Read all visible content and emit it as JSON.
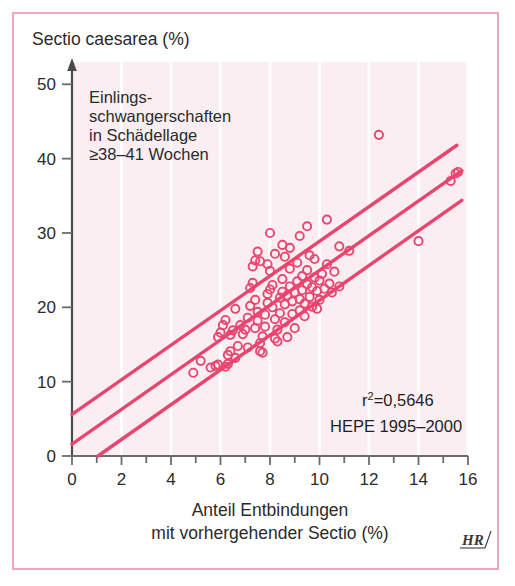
{
  "figure": {
    "background_color": "#ffffff",
    "border_color": "#efa7bd",
    "plot_tint_color": "#fbeef2",
    "series_color": "#e8456f",
    "text_color": "#2b2b2b",
    "credit_mark": "HR"
  },
  "annotations": {
    "note_line_1": "Einlings-",
    "note_line_2": "schwangerschaften",
    "note_line_3": "in Schädellage",
    "note_line_4": "≥38–41 Wochen",
    "r_squared_label": "r",
    "r_squared_exponent": "2",
    "r_squared_value": "=0,5646",
    "source": "HEPE 1995–2000"
  },
  "chart_data": {
    "type": "scatter",
    "title": "",
    "ylabel": "Sectio caesarea (%)",
    "xlabel_line_1": "Anteil Entbindungen",
    "xlabel_line_2": "mit vorhergehender Sectio (%)",
    "xlim": [
      0,
      16
    ],
    "ylim": [
      0,
      53
    ],
    "xticks": [
      0,
      1,
      2,
      3,
      4,
      5,
      6,
      7,
      8,
      9,
      10,
      11,
      12,
      13,
      14,
      15,
      16
    ],
    "xtick_labels": [
      "0",
      "",
      "2",
      "",
      "4",
      "",
      "6",
      "",
      "8",
      "",
      "10",
      "",
      "12",
      "",
      "14",
      "",
      "16"
    ],
    "yticks": [
      0,
      10,
      20,
      30,
      40,
      50
    ],
    "ytick_labels": [
      "0",
      "10",
      "20",
      "30",
      "40",
      "50"
    ],
    "grid": "faint-vertical",
    "legend": "none",
    "marker": "open-circle",
    "r_squared": 0.5646,
    "points": [
      [
        4.9,
        11.2
      ],
      [
        5.6,
        11.9
      ],
      [
        5.8,
        12.1
      ],
      [
        5.9,
        12.3
      ],
      [
        6.2,
        12.0
      ],
      [
        6.3,
        12.4
      ],
      [
        6.3,
        13.6
      ],
      [
        6.4,
        14.1
      ],
      [
        5.9,
        16.0
      ],
      [
        6.0,
        16.6
      ],
      [
        6.1,
        17.6
      ],
      [
        6.2,
        18.3
      ],
      [
        6.4,
        16.3
      ],
      [
        6.5,
        16.9
      ],
      [
        6.6,
        19.8
      ],
      [
        6.8,
        17.6
      ],
      [
        6.9,
        16.4
      ],
      [
        7.0,
        17.0
      ],
      [
        7.1,
        18.6
      ],
      [
        7.2,
        20.2
      ],
      [
        7.2,
        22.6
      ],
      [
        7.3,
        23.3
      ],
      [
        7.3,
        25.5
      ],
      [
        7.4,
        26.3
      ],
      [
        7.4,
        21.0
      ],
      [
        7.5,
        19.4
      ],
      [
        7.5,
        18.2
      ],
      [
        7.6,
        15.2
      ],
      [
        7.6,
        14.1
      ],
      [
        7.7,
        13.9
      ],
      [
        7.7,
        16.1
      ],
      [
        7.8,
        17.4
      ],
      [
        7.8,
        19.0
      ],
      [
        7.9,
        20.6
      ],
      [
        7.9,
        21.8
      ],
      [
        8.0,
        22.4
      ],
      [
        8.0,
        24.9
      ],
      [
        8.1,
        23.0
      ],
      [
        8.1,
        20.0
      ],
      [
        8.2,
        18.4
      ],
      [
        8.2,
        15.8
      ],
      [
        8.3,
        15.4
      ],
      [
        8.3,
        17.0
      ],
      [
        8.4,
        19.2
      ],
      [
        8.4,
        21.3
      ],
      [
        8.5,
        22.1
      ],
      [
        8.5,
        23.8
      ],
      [
        8.6,
        20.4
      ],
      [
        8.6,
        18.0
      ],
      [
        8.7,
        16.0
      ],
      [
        8.7,
        21.6
      ],
      [
        8.8,
        22.8
      ],
      [
        8.8,
        25.2
      ],
      [
        8.9,
        20.8
      ],
      [
        8.9,
        19.1
      ],
      [
        9.0,
        17.2
      ],
      [
        9.0,
        22.0
      ],
      [
        9.1,
        23.5
      ],
      [
        9.1,
        26.0
      ],
      [
        9.2,
        21.1
      ],
      [
        9.2,
        19.6
      ],
      [
        9.3,
        22.3
      ],
      [
        9.3,
        24.2
      ],
      [
        9.4,
        20.5
      ],
      [
        9.4,
        18.8
      ],
      [
        9.5,
        23.1
      ],
      [
        9.5,
        25.0
      ],
      [
        9.6,
        21.4
      ],
      [
        9.6,
        27.0
      ],
      [
        9.7,
        22.7
      ],
      [
        9.7,
        20.1
      ],
      [
        9.8,
        24.0
      ],
      [
        9.8,
        26.5
      ],
      [
        9.9,
        22.2
      ],
      [
        10.0,
        23.6
      ],
      [
        10.0,
        21.0
      ],
      [
        10.1,
        24.5
      ],
      [
        10.2,
        22.5
      ],
      [
        10.3,
        25.8
      ],
      [
        10.4,
        23.2
      ],
      [
        10.5,
        22.0
      ],
      [
        10.6,
        24.8
      ],
      [
        10.8,
        22.8
      ],
      [
        7.5,
        27.5
      ],
      [
        7.6,
        26.2
      ],
      [
        7.9,
        25.8
      ],
      [
        8.2,
        27.2
      ],
      [
        8.5,
        28.4
      ],
      [
        8.0,
        30.0
      ],
      [
        8.8,
        28.0
      ],
      [
        9.2,
        29.6
      ],
      [
        9.5,
        30.9
      ],
      [
        10.3,
        31.8
      ],
      [
        10.8,
        28.2
      ],
      [
        11.2,
        27.6
      ],
      [
        12.4,
        43.2
      ],
      [
        14.0,
        28.9
      ],
      [
        15.3,
        37.0
      ],
      [
        15.6,
        38.2
      ],
      [
        15.5,
        38.0
      ],
      [
        5.2,
        12.8
      ],
      [
        6.7,
        14.8
      ],
      [
        7.1,
        14.6
      ],
      [
        7.4,
        17.2
      ],
      [
        6.6,
        13.2
      ],
      [
        8.6,
        26.8
      ],
      [
        9.9,
        19.8
      ]
    ],
    "regression_lines": [
      {
        "name": "upper-bound",
        "x0": 0.0,
        "y0": 5.6,
        "x1": 15.55,
        "y1": 41.8
      },
      {
        "name": "fit",
        "x0": 0.0,
        "y0": 1.6,
        "x1": 15.75,
        "y1": 38.4
      },
      {
        "name": "lower-bound",
        "x0": 1.05,
        "y0": 0.0,
        "x1": 15.75,
        "y1": 34.4
      }
    ]
  }
}
